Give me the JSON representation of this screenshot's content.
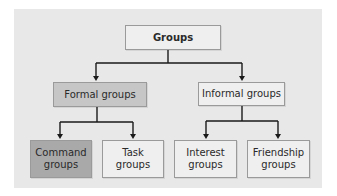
{
  "diagram": {
    "title": "Groups",
    "colors": {
      "page_bg": "#ffffff",
      "panel_bg": "#e8e8e8",
      "light_box": "#efefef",
      "medium_box": "#c6c6c6",
      "dark_box": "#a9a9a9",
      "line": "#1a1a1a"
    },
    "nodes": {
      "root": {
        "label": "Groups"
      },
      "formal": {
        "label": "Formal groups"
      },
      "informal": {
        "label": "Informal groups"
      },
      "command": {
        "line1": "Command",
        "line2": "groups"
      },
      "task": {
        "line1": "Task",
        "line2": "groups"
      },
      "interest": {
        "line1": "Interest",
        "line2": "groups"
      },
      "friendship": {
        "line1": "Friendship",
        "line2": "groups"
      }
    },
    "edges": [
      {
        "from": "Groups",
        "to": "Formal groups"
      },
      {
        "from": "Groups",
        "to": "Informal groups"
      },
      {
        "from": "Formal groups",
        "to": "Command groups"
      },
      {
        "from": "Formal groups",
        "to": "Task groups"
      },
      {
        "from": "Informal groups",
        "to": "Interest groups"
      },
      {
        "from": "Informal groups",
        "to": "Friendship groups"
      }
    ]
  }
}
